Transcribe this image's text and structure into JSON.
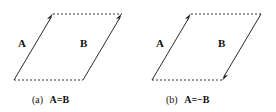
{
  "figure": {
    "background_color": "#ffffff",
    "line_color": "#2b2b2b",
    "dotted_color": "#3a3a3a",
    "arrow_color": "#1a1a1a",
    "text_color": "#111111"
  },
  "panels": [
    {
      "id": "panel-a",
      "caption_tag": "(a)",
      "caption_equation": "A=B",
      "labels": {
        "left_vector": "A",
        "right_vector": "B"
      },
      "vectors": [
        {
          "name": "A",
          "direction": "up-right",
          "style": "solid",
          "arrowhead": "end"
        },
        {
          "name": "B",
          "direction": "up-right",
          "style": "solid",
          "arrowhead": "end"
        }
      ],
      "edges": [
        {
          "name": "top-edge",
          "style": "dotted"
        },
        {
          "name": "bottom-edge",
          "style": "dotted"
        }
      ]
    },
    {
      "id": "panel-b",
      "caption_tag": "(b)",
      "caption_equation": "A=−B",
      "labels": {
        "left_vector": "A",
        "right_vector": "B"
      },
      "vectors": [
        {
          "name": "A",
          "direction": "up-right",
          "style": "solid",
          "arrowhead": "end"
        },
        {
          "name": "B",
          "direction": "down-left",
          "style": "solid",
          "arrowhead": "end"
        }
      ],
      "edges": [
        {
          "name": "top-edge",
          "style": "dotted"
        },
        {
          "name": "bottom-edge",
          "style": "dotted"
        }
      ]
    }
  ]
}
